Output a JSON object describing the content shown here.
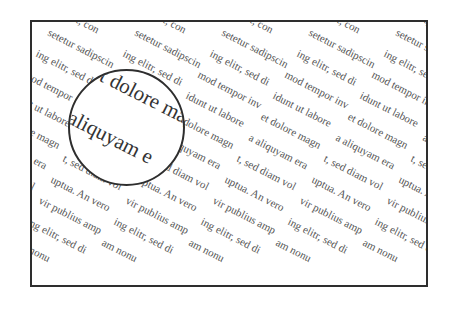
{
  "pattern": {
    "phrases": [
      "amet, con",
      "setetur sadipscin",
      "ing elitr, sed di",
      "mod tempor inv",
      "idunt ut labore",
      "et dolore magn",
      "a aliquyam era",
      "t, sed diam vol",
      "uptua. An vero",
      "vir publius amp",
      "ing elitr, sed di",
      "am nonu"
    ],
    "column_spacing": 87,
    "row_dx": -12,
    "row_dy": 21,
    "origin_x": 148,
    "origin_y": -16,
    "columns": 8
  },
  "magnifier": {
    "lines": [
      {
        "text": "t dolore mag",
        "x": 36,
        "y": -6
      },
      {
        "text": "aliquyam e",
        "x": 4,
        "y": 36
      }
    ]
  },
  "colors": {
    "frame": "#2e2e2e",
    "text": "#555555",
    "lens_text": "#333333"
  }
}
